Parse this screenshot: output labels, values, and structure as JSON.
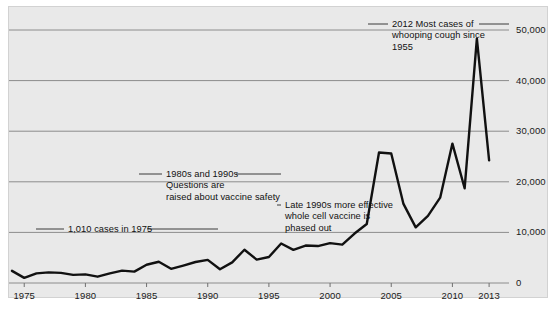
{
  "chart_data": {
    "type": "line",
    "title": "",
    "subtitle": "",
    "xlabel": "",
    "ylabel": "",
    "xlim": [
      1974,
      2013.4
    ],
    "ylim": [
      0,
      52000
    ],
    "grid": true,
    "legend": "none",
    "y_ticks": [
      "0",
      "10,000",
      "20,000",
      "30,000",
      "40,000",
      "50,000"
    ],
    "y_tick_values": [
      0,
      10000,
      20000,
      30000,
      40000,
      50000
    ],
    "x_ticks": [
      "1975",
      "1980",
      "1985",
      "1990",
      "1995",
      "2000",
      "2005",
      "2010",
      "2013"
    ],
    "x_tick_values": [
      1975,
      1980,
      1985,
      1990,
      1995,
      2000,
      2005,
      2010,
      2013
    ],
    "axis_position": {
      "y_axis": "right",
      "x_axis": "bottom"
    },
    "line_color": "#111111",
    "grid_color": "#8c8c8c",
    "background_color": "#e9e9e9",
    "series": [
      {
        "name": "Reported whooping cough cases (U.S.)",
        "x": [
          1974,
          1975,
          1976,
          1977,
          1978,
          1979,
          1980,
          1981,
          1982,
          1983,
          1984,
          1985,
          1986,
          1987,
          1988,
          1989,
          1990,
          1991,
          1992,
          1993,
          1994,
          1995,
          1996,
          1997,
          1998,
          1999,
          2000,
          2001,
          2002,
          2003,
          2004,
          2005,
          2006,
          2007,
          2008,
          2009,
          2010,
          2011,
          2012,
          2013
        ],
        "values": [
          2400,
          1010,
          1900,
          2100,
          2000,
          1600,
          1700,
          1250,
          1900,
          2450,
          2250,
          3600,
          4200,
          2800,
          3450,
          4150,
          4570,
          2720,
          4080,
          6580,
          4620,
          5140,
          7800,
          6560,
          7400,
          7300,
          7870,
          7580,
          9770,
          11650,
          25800,
          25600,
          15630,
          11000,
          13280,
          16860,
          27550,
          18720,
          48280,
          24230
        ]
      }
    ],
    "annotations": [
      {
        "id": "annot-1975",
        "text": "1,010 cases in 1975",
        "x_value": 1975,
        "y_value": 1010,
        "leader": true
      },
      {
        "id": "annot-1980s-1990s",
        "text": "1980s and 1990s\nQuestions are\nraised about vaccine safety",
        "x_value": 1990,
        "y_value": 4570,
        "leader": true
      },
      {
        "id": "annot-late-1990s",
        "text": "Late 1990s more effective\nwhole cell vaccine is\nphased out",
        "x_value": 1999,
        "y_value": 7300,
        "leader": true
      },
      {
        "id": "annot-2012",
        "text": "2012 Most cases of\nwhooping cough since\n1955",
        "x_value": 2012,
        "y_value": 48280,
        "leader": true
      }
    ]
  }
}
